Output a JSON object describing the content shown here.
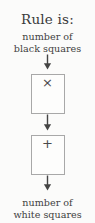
{
  "diagram": {
    "title": "Rule is:",
    "input_label": {
      "line1": "number of",
      "line2": "black squares"
    },
    "output_label": {
      "line1": "number of",
      "line2": "white squares"
    },
    "steps": [
      {
        "symbol": "×",
        "name": "multiply"
      },
      {
        "symbol": "+",
        "name": "add"
      }
    ],
    "arrows": [
      {
        "name": "arrow-input-to-multiply"
      },
      {
        "name": "arrow-multiply-to-add"
      },
      {
        "name": "arrow-add-to-output"
      }
    ],
    "colors": {
      "background": "#fbfbfa",
      "text": "#3f3f3f",
      "box_border": "#a8a8a8",
      "box_fill": "#fdfdfc",
      "arrow": "#444444"
    }
  }
}
